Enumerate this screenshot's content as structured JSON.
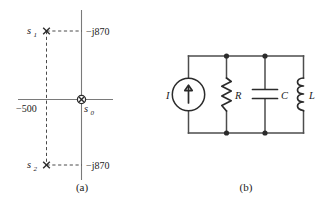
{
  "figure": {
    "panels": [
      {
        "id": "a",
        "caption": "(a)",
        "type": "s-plane-pole-plot",
        "axis": {
          "real_axis_name": "real-axis",
          "imag_axis_name": "imaginary-axis"
        },
        "poles": [
          {
            "name": "s1",
            "label": "s",
            "subscript": "1",
            "value_label": "−j870",
            "marker": "x"
          },
          {
            "name": "s0",
            "label": "s",
            "subscript": "0",
            "value_label": "",
            "marker": "x-in-circle"
          },
          {
            "name": "s2",
            "label": "s",
            "subscript": "2",
            "value_label": "−j870",
            "marker": "x"
          }
        ],
        "real_tick_label": "−500",
        "upper_imag_label": "−j870",
        "lower_imag_label": "−j870"
      },
      {
        "id": "b",
        "caption": "(b)",
        "type": "parallel-rlc-circuit",
        "components": [
          {
            "name": "current-source",
            "label": "I",
            "kind": "current-source"
          },
          {
            "name": "resistor",
            "label": "R",
            "kind": "resistor"
          },
          {
            "name": "capacitor",
            "label": "C",
            "kind": "capacitor"
          },
          {
            "name": "inductor",
            "label": "L",
            "kind": "inductor"
          }
        ]
      }
    ]
  },
  "colors": {
    "wire": "#4d4d4d",
    "component": "#2b2b2b",
    "axis": "#7a7a7a",
    "dash": "#4a4a4a",
    "background": "#ffffff"
  }
}
